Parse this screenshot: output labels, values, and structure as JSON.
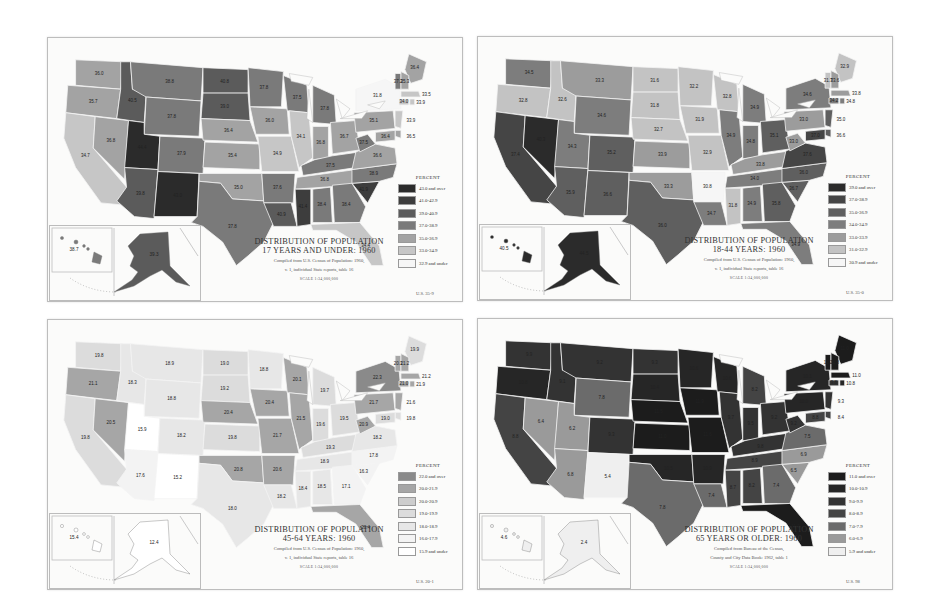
{
  "panels": [
    {
      "id": "under17",
      "title_line1": "Distribution of Population",
      "title_line2": "17 Years and Under: 1960",
      "source_line1": "Compiled from U.S. Census of Population: 1960,",
      "source_line2": "v. 1, individual State reports, table 16",
      "scale": "SCALE 1:34,000,000",
      "code": "U.S. 35-9",
      "legend_title": "PERCENT",
      "legend": [
        {
          "label": "43.0 and over",
          "color": "#2b2b2b"
        },
        {
          "label": "41.0-42.9",
          "color": "#3d3d3d"
        },
        {
          "label": "39.0-40.9",
          "color": "#5b5b5b"
        },
        {
          "label": "37.0-38.9",
          "color": "#7a7a7a"
        },
        {
          "label": "35.0-36.9",
          "color": "#a3a3a3"
        },
        {
          "label": "33.0-34.9",
          "color": "#c6c6c6"
        },
        {
          "label": "32.9 and under",
          "color": "#f6f6f6"
        }
      ],
      "insets": {
        "hawaii": "38.7",
        "alaska": "39.3"
      },
      "values": {
        "WA": "36.0",
        "OR": "35.7",
        "CA": "34.7",
        "NV": "36.8",
        "ID": "40.5",
        "MT": "38.8",
        "WY": "37.8",
        "UT": "44.4",
        "CO": "37.9",
        "AZ": "39.8",
        "NM": "43.0",
        "ND": "40.8",
        "SD": "39.0",
        "NE": "36.4",
        "KS": "35.4",
        "OK": "35.0",
        "TX": "37.8",
        "MN": "37.8",
        "IA": "36.0",
        "MO": "34.9",
        "AR": "37.6",
        "LA": "40.9",
        "WI": "37.5",
        "IL": "34.1",
        "MI": "37.8",
        "IN": "36.8",
        "OH": "36.7",
        "KY": "37.5",
        "TN": "36.8",
        "MS": "41.4",
        "AL": "38.4",
        "GA": "38.4",
        "FL": "34.4",
        "SC": "41.9",
        "NC": "38.9",
        "VA": "36.6",
        "WV": "37.5",
        "PA": "35.1",
        "NY": "31.8",
        "ME": "36.4",
        "VT": "37.2",
        "NH": "35.3",
        "MA": "33.5",
        "CT": "34.0",
        "RI": "33.9",
        "NJ": "33.9",
        "DE": "36.5",
        "MD": "36.4"
      }
    },
    {
      "id": "18to44",
      "title_line1": "Distribution of Population",
      "title_line2": "18-44 Years: 1960",
      "source_line1": "Compiled from U.S. Census of Population: 1960,",
      "source_line2": "v. 1, individual State reports, table 16",
      "scale": "SCALE 1:34,000,000",
      "code": "U.S. 35-0",
      "legend_title": "PERCENT",
      "legend": [
        {
          "label": "39.0 and over",
          "color": "#2b2b2b"
        },
        {
          "label": "37.0-38.9",
          "color": "#454545"
        },
        {
          "label": "35.0-36.9",
          "color": "#5f5f5f"
        },
        {
          "label": "34.0-34.9",
          "color": "#7d7d7d"
        },
        {
          "label": "33.0-33.9",
          "color": "#9c9c9c"
        },
        {
          "label": "31.0-32.9",
          "color": "#c3c3c3"
        },
        {
          "label": "30.9 and under",
          "color": "#f6f6f6"
        }
      ],
      "insets": {
        "hawaii": "40.5",
        "alaska": "44.5"
      },
      "values": {
        "WA": "34.5",
        "OR": "32.8",
        "CA": "37.4",
        "NV": "40.3",
        "ID": "32.6",
        "MT": "33.3",
        "WY": "34.6",
        "UT": "34.3",
        "CO": "35.2",
        "AZ": "35.9",
        "NM": "36.6",
        "ND": "31.6",
        "SD": "31.8",
        "NE": "32.7",
        "KS": "33.9",
        "OK": "33.3",
        "TX": "36.0",
        "MN": "32.2",
        "IA": "31.9",
        "MO": "32.9",
        "AR": "30.8",
        "LA": "34.7",
        "WI": "32.8",
        "IL": "34.9",
        "MI": "34.9",
        "IN": "34.8",
        "OH": "35.1",
        "KY": "33.8",
        "TN": "34.0",
        "MS": "31.8",
        "AL": "34.9",
        "GA": "35.8",
        "FL": "34.9",
        "SC": "36.7",
        "NC": "36.0",
        "VA": "37.6",
        "WV": "33.0",
        "PA": "33.0",
        "NY": "34.6",
        "ME": "32.9",
        "VT": "31.7",
        "NH": "33.6",
        "MA": "33.8",
        "CT": "34.2",
        "RI": "34.8",
        "NJ": "35.0",
        "DE": "36.6",
        "MD": "37.0"
      }
    },
    {
      "id": "45to64",
      "title_line1": "Distribution of Population",
      "title_line2": "45-64 Years: 1960",
      "source_line1": "Compiled from U.S. Census of Population: 1960,",
      "source_line2": "v. 1, individual State reports, table 16",
      "scale": "SCALE 1:34,000,000",
      "code": "U.S. 20-1",
      "legend_title": "PERCENT",
      "legend": [
        {
          "label": "22.0 and over",
          "color": "#8a8a8a"
        },
        {
          "label": "20.0-21.9",
          "color": "#a6a6a6"
        },
        {
          "label": "20.0-20.9",
          "color": "#cdcdcd"
        },
        {
          "label": "19.0-19.9",
          "color": "#dcdcdc"
        },
        {
          "label": "18.0-18.9",
          "color": "#e7e7e7"
        },
        {
          "label": "16.0-17.9",
          "color": "#f3f3f3"
        },
        {
          "label": "15.9 and under",
          "color": "#ffffff"
        }
      ],
      "insets": {
        "hawaii": "15.4",
        "alaska": "12.4"
      },
      "values": {
        "WA": "19.8",
        "OR": "21.1",
        "CA": "19.8",
        "NV": "20.5",
        "ID": "18.3",
        "MT": "18.9",
        "WY": "18.8",
        "UT": "15.9",
        "CO": "18.2",
        "AZ": "17.6",
        "NM": "15.2",
        "ND": "19.0",
        "SD": "19.2",
        "NE": "20.4",
        "KS": "19.8",
        "OK": "20.8",
        "TX": "18.0",
        "MN": "18.8",
        "IA": "20.4",
        "MO": "21.7",
        "AR": "20.6",
        "LA": "18.2",
        "WI": "20.1",
        "IL": "21.5",
        "MI": "19.7",
        "IN": "19.6",
        "OH": "19.5",
        "KY": "19.3",
        "TN": "18.9",
        "MS": "18.4",
        "AL": "18.5",
        "GA": "17.1",
        "FL": "20.4",
        "SC": "16.3",
        "NC": "17.8",
        "VA": "18.2",
        "WV": "20.9",
        "PA": "21.7",
        "NY": "22.3",
        "ME": "19.9",
        "VT": "20.1",
        "NH": "21.2",
        "MA": "21.2",
        "CT": "21.0",
        "RI": "21.9",
        "NJ": "21.6",
        "DE": "19.8",
        "MD": "19.0"
      }
    },
    {
      "id": "65plus",
      "title_line1": "Distribution of Population",
      "title_line2": "65 Years or Older: 1960",
      "source_line1": "Compiled from Bureau of the Census,",
      "source_line2": "County and City Data Book: 1962, table 1",
      "scale": "SCALE 1:34,000,000",
      "code": "U.S. 98",
      "legend_title": "PERCENT",
      "legend": [
        {
          "label": "11.0 and over",
          "color": "#1c1c1c"
        },
        {
          "label": "10.0-10.9",
          "color": "#262626"
        },
        {
          "label": "9.0-9.9",
          "color": "#333333"
        },
        {
          "label": "8.0-8.9",
          "color": "#444444"
        },
        {
          "label": "7.0-7.9",
          "color": "#6b6b6b"
        },
        {
          "label": "6.0-6.9",
          "color": "#9a9a9a"
        },
        {
          "label": "5.9 and under",
          "color": "#efefef"
        }
      ],
      "insets": {
        "hawaii": "4.6",
        "alaska": "2.4"
      },
      "values": {
        "WA": "9.9",
        "OR": "10.8",
        "CA": "8.8",
        "NV": "6.4",
        "ID": "9.1",
        "MT": "9.2",
        "WY": "7.8",
        "UT": "6.2",
        "CO": "9.3",
        "AZ": "6.8",
        "NM": "5.4",
        "ND": "9.3",
        "SD": "10.4",
        "NE": "11.5",
        "KS": "11.0",
        "OK": "10.5",
        "TX": "7.8",
        "MN": "10.6",
        "IA": "11.9",
        "MO": "11.6",
        "AR": "10.9",
        "LA": "7.4",
        "WI": "10.6",
        "IL": "9.7",
        "MI": "8.2",
        "IN": "9.5",
        "OH": "9.2",
        "KY": "9.8",
        "TN": "8.9",
        "MS": "8.7",
        "AL": "8.2",
        "GA": "7.4",
        "FL": "11.2",
        "SC": "6.5",
        "NC": "6.9",
        "VA": "7.5",
        "WV": "9.2",
        "PA": "10.0",
        "NY": "10.1",
        "ME": "11.0",
        "VT": "11.2",
        "NH": "11.8",
        "MA": "11.0",
        "CT": "9.8",
        "RI": "10.8",
        "NJ": "9.3",
        "DE": "8.4",
        "MD": "8.8"
      }
    }
  ]
}
